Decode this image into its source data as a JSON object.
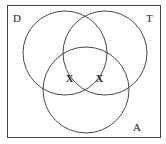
{
  "diagram": {
    "type": "venn",
    "sets": [
      {
        "label": "D",
        "cx": 65,
        "cy": 53,
        "r": 42
      },
      {
        "label": "T",
        "cx": 105,
        "cy": 53,
        "r": 42
      },
      {
        "label": "A",
        "cx": 86,
        "cy": 90,
        "r": 43
      }
    ],
    "marks": [
      {
        "text": "X",
        "x": 70,
        "y": 83
      },
      {
        "text": "X",
        "x": 100,
        "y": 83
      }
    ],
    "colors": {
      "stroke": "#333333",
      "background": "#ffffff"
    }
  }
}
